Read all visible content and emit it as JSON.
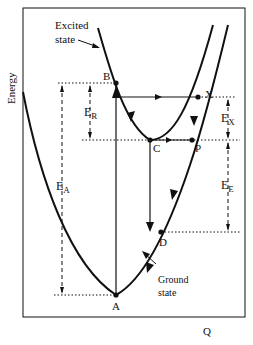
{
  "diagram": {
    "type": "configuration-coordinate-diagram",
    "axes": {
      "y_label": "Energy",
      "x_label": "Q"
    },
    "curves": {
      "excited": {
        "label_line1": "Excited",
        "label_line2": "state"
      },
      "ground": {
        "label_line1": "Ground",
        "label_line2": "state"
      }
    },
    "points": {
      "A": "A",
      "B": "B",
      "C": "C",
      "D": "D",
      "P": "P",
      "X": "X"
    },
    "energies": {
      "E_R": {
        "main": "E",
        "sub": "R"
      },
      "E_A": {
        "main": "E",
        "sub": "A"
      },
      "E_X": {
        "main": "E",
        "sub": "X"
      },
      "E_E": {
        "main": "E",
        "sub": "E"
      }
    },
    "colors": {
      "line": "#111111",
      "background": "#ffffff"
    }
  }
}
